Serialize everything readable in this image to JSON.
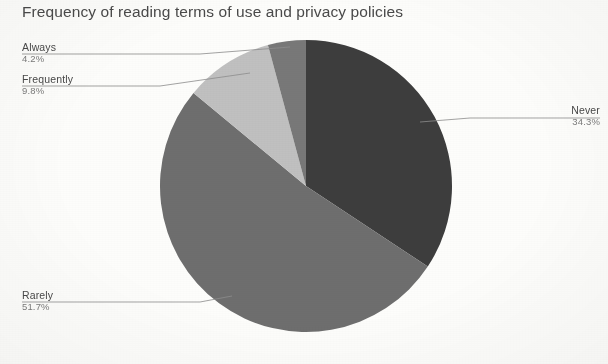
{
  "chart_data": {
    "type": "pie",
    "title": "Frequency of reading terms of use and privacy policies",
    "xlabel": "",
    "ylabel": "",
    "legend_position": "callout-labels",
    "grid": false,
    "start_angle_deg": 0,
    "direction": "clockwise",
    "categories": [
      "Never",
      "Rarely",
      "Frequently",
      "Always"
    ],
    "values": [
      34.3,
      51.7,
      9.8,
      4.2
    ],
    "value_unit": "%",
    "total": 100.0,
    "slices": [
      {
        "label": "Never",
        "value": 34.3,
        "value_text": "34.3%",
        "color": "#3d3d3d"
      },
      {
        "label": "Rarely",
        "value": 51.7,
        "value_text": "51.7%",
        "color": "#6e6e6e"
      },
      {
        "label": "Frequently",
        "value": 9.8,
        "value_text": "9.8%",
        "color": "#c0c0c0"
      },
      {
        "label": "Always",
        "value": 4.2,
        "value_text": "4.2%",
        "color": "#787878"
      }
    ]
  },
  "title": "Frequency of reading terms of use and privacy policies",
  "callouts": {
    "always": {
      "label": "Always",
      "value": "4.2%"
    },
    "frequently": {
      "label": "Frequently",
      "value": "9.8%"
    },
    "never": {
      "label": "Never",
      "value": "34.3%"
    },
    "rarely": {
      "label": "Rarely",
      "value": "51.7%"
    }
  },
  "colors": {
    "never": "#3d3d3d",
    "rarely": "#6e6e6e",
    "frequently": "#c0c0c0",
    "always": "#787878",
    "background": "#fdfdfb",
    "title_text": "#4a4a4a",
    "label_text": "#494949",
    "value_text": "#7b7b7b",
    "leader_line": "#8d8d8d"
  }
}
